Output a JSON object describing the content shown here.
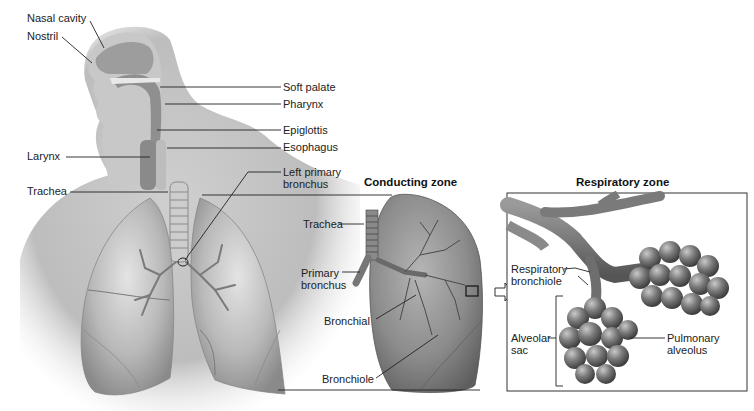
{
  "figure": {
    "colors": {
      "background": "#ffffff",
      "tissue_light": "#d8d8d8",
      "tissue_mid": "#a8a8a8",
      "tissue_dark": "#6e6e6e",
      "leader_line": "#222222",
      "text": "#222222"
    }
  },
  "upper_tract": {
    "labels": [
      {
        "id": "nasal-cavity",
        "text": "Nasal cavity"
      },
      {
        "id": "nostril",
        "text": "Nostril"
      },
      {
        "id": "soft-palate",
        "text": "Soft palate"
      },
      {
        "id": "pharynx",
        "text": "Pharynx"
      },
      {
        "id": "epiglottis",
        "text": "Epiglottis"
      },
      {
        "id": "esophagus",
        "text": "Esophagus"
      },
      {
        "id": "larynx",
        "text": "Larynx"
      },
      {
        "id": "trachea",
        "text": "Trachea"
      },
      {
        "id": "left-primary-bronchus-1",
        "text": "Left primary"
      },
      {
        "id": "left-primary-bronchus-2",
        "text": "bronchus"
      }
    ]
  },
  "conducting_zone": {
    "title": "Conducting zone",
    "labels": [
      {
        "id": "trachea",
        "text": "Trachea"
      },
      {
        "id": "primary-bronchus-1",
        "text": "Primary"
      },
      {
        "id": "primary-bronchus-2",
        "text": "bronchus"
      },
      {
        "id": "bronchial",
        "text": "Bronchial"
      },
      {
        "id": "bronchiole",
        "text": "Bronchiole"
      }
    ]
  },
  "respiratory_zone": {
    "title": "Respiratory zone",
    "labels": [
      {
        "id": "respiratory-bronchiole-1",
        "text": "Respiratory"
      },
      {
        "id": "respiratory-bronchiole-2",
        "text": "bronchiole"
      },
      {
        "id": "alveolar-sac-1",
        "text": "Alveolar"
      },
      {
        "id": "alveolar-sac-2",
        "text": "sac"
      },
      {
        "id": "pulmonary-alveolus-1",
        "text": "Pulmonary"
      },
      {
        "id": "pulmonary-alveolus-2",
        "text": "alveolus"
      }
    ]
  }
}
